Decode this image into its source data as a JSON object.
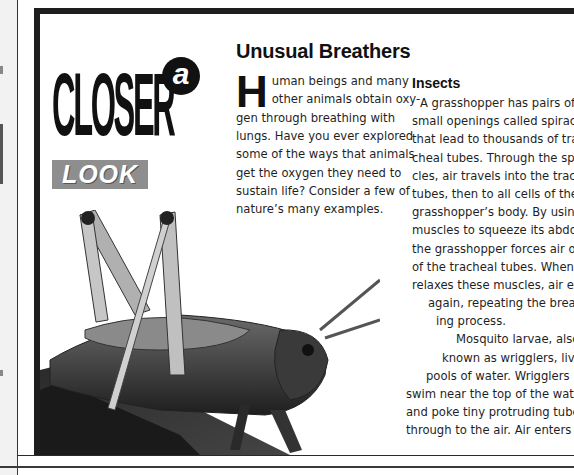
{
  "page": {
    "feature_logo": {
      "small_word": "a",
      "big_word": "CLOSER",
      "banner_word": "LOOK"
    },
    "headline": "Unusual Breathers",
    "intro": {
      "drop_cap": "H",
      "lines": [
        "uman beings and many",
        "other animals obtain oxy-",
        "gen through breathing with",
        "lungs. Have you ever explored",
        "some of the ways that animals",
        "get the oxygen they need to",
        "sustain life? Consider a few of",
        "nature’s many examples."
      ]
    },
    "section": {
      "subhead": "Insects",
      "lines": [
        "A grasshopper has pairs of",
        "small openings called spiracles",
        "that lead to thousands of tra-",
        "cheal tubes. Through the spira-",
        "cles, air travels into the tracheal",
        "tubes, then to all cells of the",
        "grasshopper’s body. By using",
        "muscles to squeeze its abdomen,",
        "the grasshopper forces air out",
        "of the tracheal tubes. When it",
        "relaxes these muscles, air enters",
        "again, repeating the breath-",
        "ing process.",
        "Mosquito larvae, also",
        "known as wrigglers, live in",
        "pools of water. Wrigglers",
        "swim near the top of the water",
        "and poke tiny protruding tubes",
        "through to the air. Air enters"
      ],
      "line_indents": [
        8,
        0,
        0,
        0,
        0,
        0,
        0,
        0,
        0,
        0,
        0,
        16,
        24,
        44,
        30,
        14,
        0,
        0,
        0
      ]
    },
    "illustration": {
      "subject": "grasshopper-on-branch-photo"
    },
    "colors": {
      "frame": "#1e1e1e",
      "text": "#1f1f1f",
      "look_banner": "#8e8e8e",
      "page_strip": "#f2f2f2"
    }
  }
}
